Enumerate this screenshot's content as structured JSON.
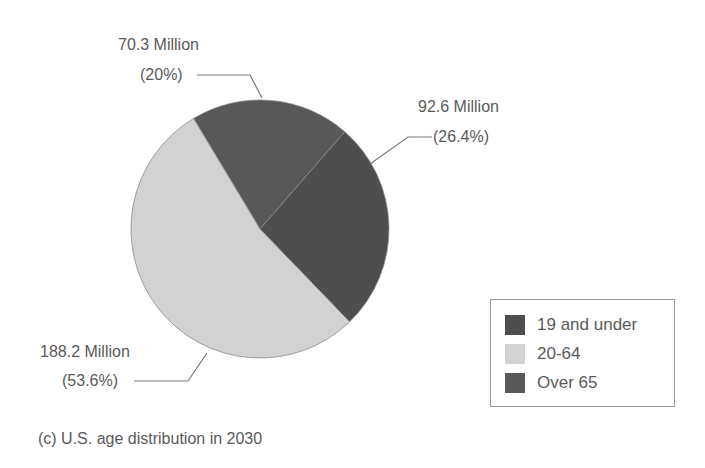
{
  "chart_data": {
    "type": "pie",
    "title": "",
    "caption": "(c) U.S. age distribution in 2030",
    "categories": [
      "19 and under",
      "20-64",
      "Over 65"
    ],
    "values": [
      92.6,
      188.2,
      70.3
    ],
    "units": "Million",
    "percentages": [
      26.4,
      53.6,
      20
    ],
    "slices": [
      {
        "name": "Over 65",
        "value": 70.3,
        "percent": 20,
        "label_line1": "70.3 Million",
        "label_line2": "(20%)",
        "color": "#585858"
      },
      {
        "name": "19 and under",
        "value": 92.6,
        "percent": 26.4,
        "label_line1": "92.6 Million",
        "label_line2": "(26.4%)",
        "color": "#4e4e4e"
      },
      {
        "name": "20-64",
        "value": 188.2,
        "percent": 53.6,
        "label_line1": "188.2 Million",
        "label_line2": "(53.6%)",
        "color": "#d2d2d2"
      }
    ],
    "legend": {
      "position": "lower-right",
      "entries": [
        {
          "label": "19 and under",
          "color": "#4e4e4e"
        },
        {
          "label": "20-64",
          "color": "#d2d2d2"
        },
        {
          "label": "Over 65",
          "color": "#585858"
        }
      ]
    },
    "start_angle_deg": -31,
    "direction": "clockwise",
    "grid": false
  },
  "labels": {
    "over65_line1": "70.3 Million",
    "over65_line2": "(20%)",
    "under19_line1": "92.6 Million",
    "under19_line2": "(26.4%)",
    "mid_line1": "188.2 Million",
    "mid_line2": "(53.6%)"
  },
  "legend": {
    "item0": "19 and under",
    "item1": "20-64",
    "item2": "Over 65"
  },
  "caption": "(c) U.S. age distribution in 2030"
}
